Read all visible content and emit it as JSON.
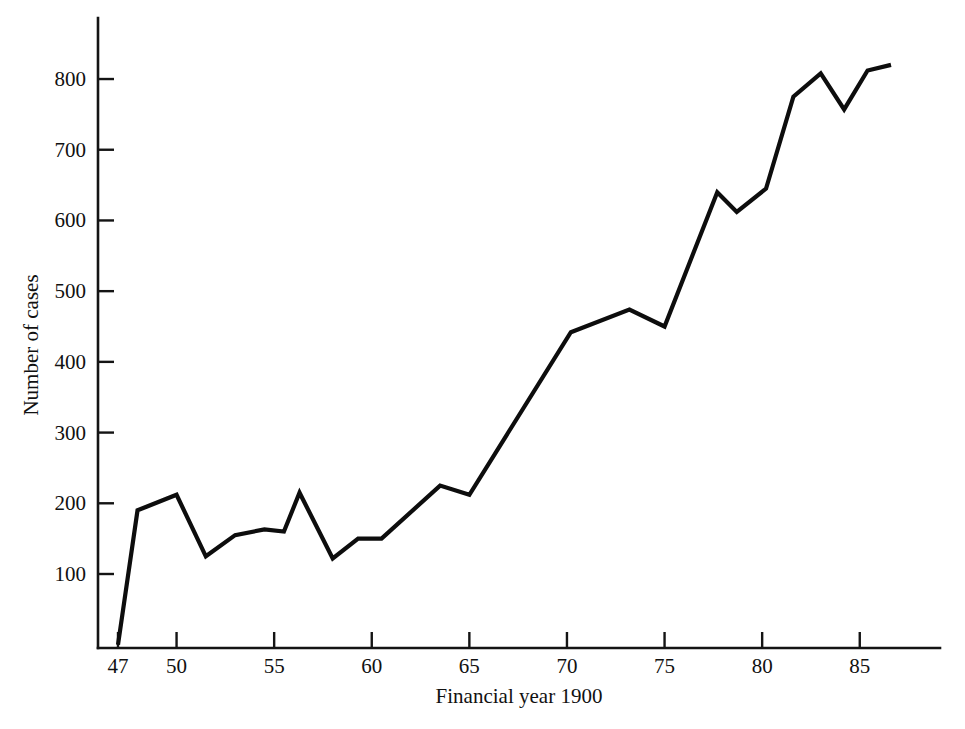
{
  "chart_data": {
    "type": "line",
    "title": "",
    "xlabel": "Financial year 1900",
    "ylabel": "Number of cases",
    "grid": false,
    "legend": "none",
    "xlim": [
      46.0,
      88.0
    ],
    "ylim": [
      0,
      850
    ],
    "xticks": [
      47,
      50,
      55,
      60,
      65,
      70,
      75,
      80,
      85
    ],
    "xtick_labels": [
      "47",
      "50",
      "55",
      "60",
      "65",
      "70",
      "75",
      "80",
      "85"
    ],
    "yticks": [
      100,
      200,
      300,
      400,
      500,
      600,
      700,
      800
    ],
    "ytick_labels": [
      "100",
      "200",
      "300",
      "400",
      "500",
      "600",
      "700",
      "800"
    ],
    "series": [
      {
        "name": "Number of cases",
        "color": "#0d0d0d",
        "x": [
          47.0,
          48.0,
          50.0,
          51.5,
          53.0,
          54.5,
          55.5,
          56.3,
          58.0,
          59.3,
          60.5,
          63.5,
          65.0,
          70.2,
          73.2,
          75.0,
          77.7,
          78.7,
          80.2,
          81.6,
          83.0,
          84.2,
          85.4,
          86.6
        ],
        "y": [
          0,
          190,
          212,
          125,
          155,
          163,
          160,
          215,
          122,
          150,
          150,
          225,
          212,
          442,
          474,
          450,
          640,
          612,
          645,
          775,
          808,
          757,
          812,
          820
        ]
      }
    ]
  },
  "axes": {
    "y_axis_name": "y-axis",
    "x_axis_name": "x-axis"
  }
}
